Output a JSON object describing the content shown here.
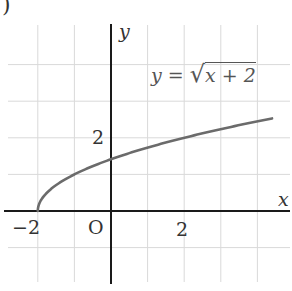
{
  "chart_data": {
    "type": "line",
    "title": "",
    "equation_label": "y = √(x + 2)",
    "xlabel": "x",
    "ylabel": "y",
    "origin_label": "O",
    "x_tick_labels": [
      "−2",
      "2"
    ],
    "y_tick_labels": [
      "2"
    ],
    "grid": true,
    "xlim": [
      -2.9,
      4.9
    ],
    "ylim": [
      -1.9,
      5.0
    ],
    "series": [
      {
        "name": "y = sqrt(x + 2)",
        "x": [
          -2,
          -1.5,
          -1,
          -0.5,
          0,
          0.5,
          1,
          1.5,
          2,
          2.5,
          3,
          3.5,
          4,
          4.4
        ],
        "values": [
          0,
          0.71,
          1,
          1.22,
          1.41,
          1.58,
          1.73,
          1.87,
          2,
          2.12,
          2.24,
          2.35,
          2.45,
          2.53
        ]
      }
    ],
    "colors": {
      "curve": "#6b6b6b",
      "axis": "#1a1a1a",
      "grid": "#d9d9d9"
    }
  },
  "labels": {
    "corner": ")",
    "y_axis": "y",
    "x_axis": "x",
    "origin": "O",
    "x_neg2": "−2",
    "x_2": "2",
    "y_2": "2",
    "eq_lhs": "y =",
    "eq_rad": "x + 2"
  }
}
